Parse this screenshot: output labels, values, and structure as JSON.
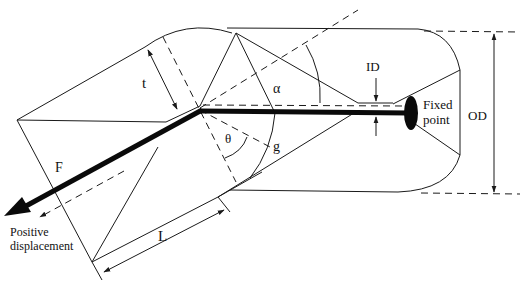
{
  "diagram": {
    "colors": {
      "line": "#1a1a1a",
      "rod": "#0a0a0a",
      "background": "#ffffff"
    },
    "labels": {
      "thickness": "t",
      "alpha": "α",
      "theta": "θ",
      "g": "g",
      "inner_diameter": "ID",
      "outer_diameter": "OD",
      "fixed_point_line1": "Fixed",
      "fixed_point_line2": "point",
      "force": "F",
      "length": "L",
      "positive_line1": "Positive",
      "positive_line2": "displacement"
    }
  }
}
